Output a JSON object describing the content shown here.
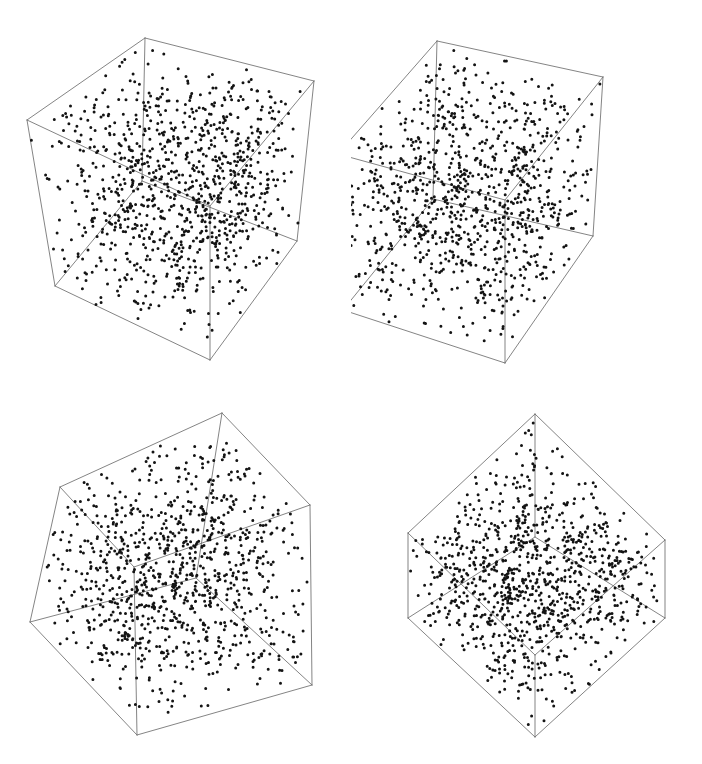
{
  "figure": {
    "width": 702,
    "height": 764,
    "background_color": "#ffffff",
    "point_color": "#141414",
    "edge_color": "#6e6e6e",
    "point_radius_px": 1.5,
    "edge_width_px": 0.85,
    "layout": "2x2 grid of 3D scatter plots inside wireframe cubes",
    "axes_visible": false,
    "tick_labels_visible": false,
    "legend_visible": false,
    "panel_labels_visible": false
  },
  "chart_data": {
    "type": "scatter",
    "title": "",
    "subtitle": "",
    "xlabel": "",
    "ylabel": "",
    "zlabel": "",
    "grid": false,
    "legend_position": "none",
    "axis_ranges": {
      "x": [
        0,
        1
      ],
      "y": [
        0,
        1
      ],
      "z": [
        0,
        1
      ]
    },
    "panels": [
      {
        "id": "panel-top-left",
        "name": "uniform-random-triplets-view-a",
        "row": 0,
        "col": 0,
        "n_points": 1000,
        "distribution": "uniform",
        "structure": "none",
        "description": "Uniformly scattered points filling the unit cube, no visible planar structure",
        "seed": 17,
        "view": {
          "azimuth_deg": 33,
          "elevation_deg": 22,
          "roll_deg": 0
        },
        "cube_vertices_px": {
          "front_bottom": [
            210,
            360
          ],
          "left_bottom": [
            55,
            286
          ],
          "right_bottom": [
            297,
            241
          ],
          "back_bottom": [
            142,
            181
          ],
          "front_top": [
            210,
            206
          ],
          "left_top": [
            27,
            120
          ],
          "right_top": [
            314,
            81
          ],
          "back_top": [
            145,
            38
          ]
        }
      },
      {
        "id": "panel-top-right",
        "name": "uniform-random-triplets-view-b",
        "row": 0,
        "col": 1,
        "n_points": 1000,
        "distribution": "uniform",
        "structure": "none",
        "description": "Uniformly scattered points filling the unit cube from a second viewpoint",
        "seed": 93,
        "view": {
          "azimuth_deg": 38,
          "elevation_deg": 17,
          "roll_deg": 0
        },
        "cube_vertices_px": {
          "front_bottom": [
            154,
            363
          ],
          "left_bottom": [
            -8,
            310
          ],
          "right_bottom": [
            242,
            236
          ],
          "back_bottom": [
            82,
            199
          ],
          "front_top": [
            154,
            200
          ],
          "left_top": [
            -13,
            154
          ],
          "right_top": [
            252,
            77
          ],
          "back_top": [
            86,
            41
          ]
        }
      },
      {
        "id": "panel-bottom-left",
        "name": "uniform-random-triplets-view-c",
        "row": 1,
        "col": 0,
        "n_points": 1000,
        "distribution": "uniform",
        "structure": "none",
        "description": "Uniformly scattered points in a rotated/tilted cube, still structureless",
        "seed": 251,
        "view": {
          "azimuth_deg": 25,
          "elevation_deg": 12,
          "roll_deg": -9
        },
        "cube_vertices_px": {
          "front_bottom": [
            137,
            353
          ],
          "left_bottom": [
            30,
            240
          ],
          "right_bottom": [
            312,
            303
          ],
          "back_bottom": [
            196,
            196
          ],
          "front_top": [
            134,
            185
          ],
          "left_top": [
            60,
            105
          ],
          "right_top": [
            310,
            123
          ],
          "back_top": [
            222,
            31
          ]
        }
      },
      {
        "id": "panel-bottom-right",
        "name": "randu-lattice-hyperplanes",
        "row": 1,
        "col": 1,
        "n_points": 1000,
        "distribution": "linear-congruential (RANDU-like)",
        "structure": "points collapse onto a family of parallel hyperplanes",
        "n_visible_planes": 15,
        "description": "Points lie on roughly 15 parallel planes seen edge-on, the classic RANDU lattice defect",
        "seed": 7,
        "view": {
          "azimuth_deg": 45,
          "elevation_deg": 30,
          "roll_deg": 0
        },
        "cube_vertices_px": {
          "front_bottom": [
            184,
            355
          ],
          "left_bottom": [
            57,
            236
          ],
          "right_bottom": [
            314,
            236
          ],
          "back_bottom": [
            184,
            155
          ],
          "front_top": [
            184,
            273
          ],
          "left_top": [
            57,
            151
          ],
          "right_top": [
            314,
            158
          ],
          "back_top": [
            184,
            32
          ]
        }
      }
    ]
  }
}
